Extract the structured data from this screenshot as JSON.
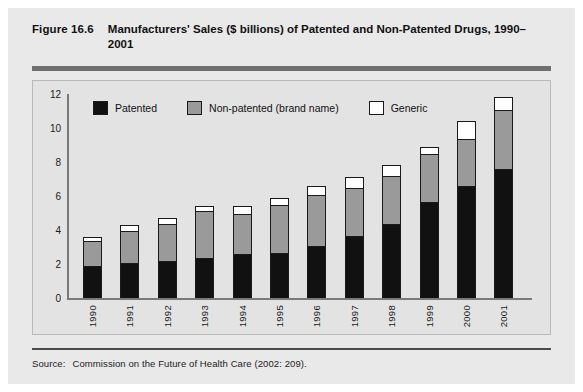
{
  "figure": {
    "number": "Figure 16.6",
    "title": "Manufacturers' Sales ($ billions) of Patented and Non-Patented Drugs, 1990–2001",
    "source_label": "Source:",
    "source_text": "Commission on the Future of Health Care (2002: 209)."
  },
  "colors": {
    "page_background": "#e9e9e9",
    "plot_background": "#e3e3e3",
    "patented": "#111111",
    "non_patented": "#9a9a9a",
    "generic": "#ffffff",
    "outline": "#1a1a1a",
    "axis": "#7a7a7a",
    "title_rule": "#6f6f6f"
  },
  "chart_data": {
    "type": "bar",
    "stacked": true,
    "title": "Manufacturers' Sales ($ billions) of Patented and Non-Patented Drugs, 1990–2001",
    "xlabel": "",
    "ylabel": "",
    "ylim": [
      0,
      12
    ],
    "yticks": [
      0,
      2,
      4,
      6,
      8,
      10,
      12
    ],
    "grid": false,
    "legend_position": "top-left-inside",
    "categories": [
      "1990",
      "1991",
      "1992",
      "1993",
      "1994",
      "1995",
      "1996",
      "1997",
      "1998",
      "1999",
      "2000",
      "2001"
    ],
    "series": [
      {
        "name": "Patented",
        "color": "#111111",
        "values": [
          1.85,
          2.0,
          2.1,
          2.3,
          2.5,
          2.6,
          3.0,
          3.6,
          4.3,
          5.6,
          6.5,
          7.5
        ]
      },
      {
        "name": "Non-patented (brand name)",
        "color": "#9a9a9a",
        "values": [
          1.45,
          1.9,
          2.2,
          2.75,
          2.4,
          2.8,
          3.0,
          2.8,
          2.8,
          2.8,
          2.8,
          3.5
        ]
      },
      {
        "name": "Generic",
        "color": "#ffffff",
        "values": [
          0.3,
          0.4,
          0.4,
          0.35,
          0.5,
          0.5,
          0.6,
          0.7,
          0.7,
          0.5,
          1.1,
          0.8
        ]
      }
    ],
    "totals": [
      3.6,
      4.3,
      4.7,
      5.4,
      5.4,
      5.9,
      6.6,
      7.1,
      7.8,
      8.9,
      10.4,
      11.8
    ]
  }
}
